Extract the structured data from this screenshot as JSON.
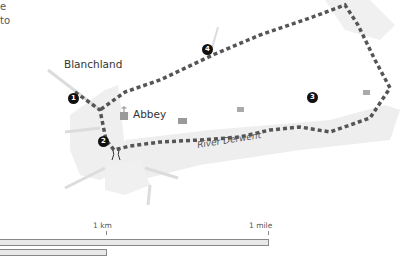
{
  "text_fragments": [
    "e",
    "to"
  ],
  "places": {
    "village": "Blanchland",
    "abbey": "Abbey",
    "river": "River Derwent"
  },
  "waypoints": [
    "1",
    "2",
    "3",
    "4"
  ],
  "scale": {
    "km_label": "1 km",
    "mile_label": "1 mile"
  },
  "colors": {
    "route": "#555555",
    "land": "#ececec",
    "road": "#dcdcdc",
    "building": "#9a9a9a",
    "marker": "#111111"
  }
}
